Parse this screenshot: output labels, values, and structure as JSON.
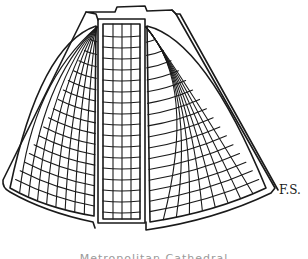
{
  "drawing": {
    "subject": "Metropolitan Cathedral",
    "style": "hand-drawn line sketch",
    "ink_color": "#1a1a1a",
    "background": "#ffffff"
  },
  "signature": "F.S.",
  "caption": "Metropolitan Cathedral"
}
